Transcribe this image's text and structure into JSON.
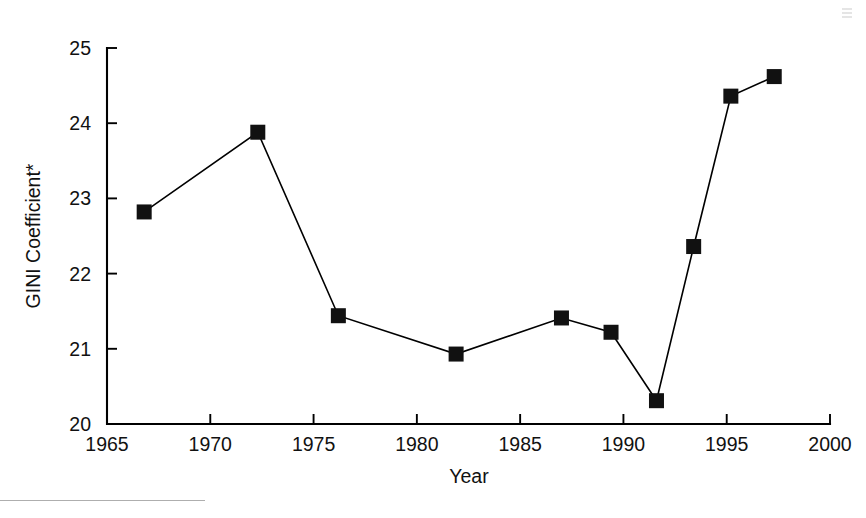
{
  "chart_data": {
    "type": "line",
    "title": "",
    "xlabel": "Year",
    "ylabel": "GINI Coefficient*",
    "xlim": [
      1965,
      2000
    ],
    "ylim": [
      20,
      25
    ],
    "grid": false,
    "legend": null,
    "marker_style": "filled-square",
    "line_color": "#000000",
    "marker_color": "#111111",
    "xticks": [
      1965,
      1970,
      1975,
      1980,
      1985,
      1990,
      1995,
      2000
    ],
    "xticklabels": [
      "1965",
      "1970",
      "1975",
      "1980",
      "1985",
      "1990",
      "1995",
      "2000"
    ],
    "yticks": [
      20,
      21,
      22,
      23,
      24,
      25
    ],
    "yticklabels": [
      "20",
      "21",
      "22",
      "23",
      "24",
      "25"
    ],
    "x": [
      1966.8,
      1972.3,
      1976.2,
      1981.9,
      1987.0,
      1989.4,
      1991.6,
      1993.4,
      1995.2,
      1997.3
    ],
    "values": [
      22.82,
      23.88,
      21.44,
      20.93,
      21.41,
      21.22,
      20.31,
      22.36,
      24.36,
      24.62
    ],
    "points": [
      {
        "x": 1966.8,
        "y": 22.82
      },
      {
        "x": 1972.3,
        "y": 23.88
      },
      {
        "x": 1976.2,
        "y": 21.44
      },
      {
        "x": 1981.9,
        "y": 20.93
      },
      {
        "x": 1987.0,
        "y": 21.41
      },
      {
        "x": 1989.4,
        "y": 21.22
      },
      {
        "x": 1991.6,
        "y": 20.31
      },
      {
        "x": 1993.4,
        "y": 22.36
      },
      {
        "x": 1995.2,
        "y": 24.36
      },
      {
        "x": 1997.3,
        "y": 24.62
      }
    ],
    "annotations": []
  },
  "figure": {
    "background": "#ffffff"
  }
}
